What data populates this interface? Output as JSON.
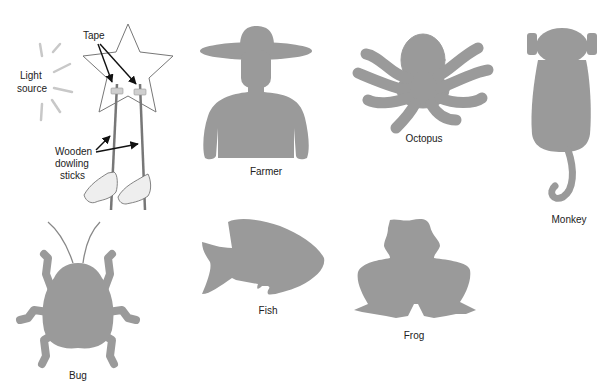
{
  "figure": {
    "fill_color": "#9a9a9a",
    "outline_color": "#888888",
    "demo": {
      "labels": {
        "tape": "Tape",
        "light_source": [
          "Light",
          "source"
        ],
        "sticks": [
          "Wooden",
          "dowling",
          "sticks"
        ]
      }
    },
    "puppets": [
      {
        "name": "Farmer"
      },
      {
        "name": "Octopus"
      },
      {
        "name": "Monkey"
      },
      {
        "name": "Bug"
      },
      {
        "name": "Fish"
      },
      {
        "name": "Frog"
      }
    ]
  }
}
